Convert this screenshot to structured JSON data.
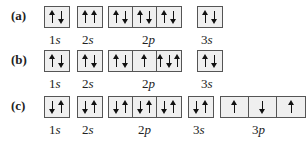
{
  "rows": [
    {
      "label": "(a)",
      "subshells": [
        {
          "name": "1s",
          "num": "1",
          "letter": "s",
          "orbitals": [
            [
              "up",
              "down"
            ]
          ]
        },
        {
          "name": "2s",
          "num": "2",
          "letter": "s",
          "orbitals": [
            [
              "up",
              "up"
            ]
          ]
        },
        {
          "name": "2p",
          "num": "2",
          "letter": "p",
          "orbitals": [
            [
              "up",
              "down"
            ],
            [
              "up",
              "down"
            ],
            [
              "up",
              "down"
            ]
          ]
        },
        {
          "name": "3s",
          "num": "3",
          "letter": "s",
          "orbitals": [
            [
              "up",
              "down"
            ]
          ]
        }
      ]
    },
    {
      "label": "(b)",
      "subshells": [
        {
          "name": "1s",
          "num": "1",
          "letter": "s",
          "orbitals": [
            [
              "up",
              "down"
            ]
          ]
        },
        {
          "name": "2s",
          "num": "2",
          "letter": "s",
          "orbitals": [
            [
              "up",
              "down"
            ]
          ]
        },
        {
          "name": "2p",
          "num": "2",
          "letter": "p",
          "orbitals": [
            [
              "up",
              "down"
            ],
            [
              "up"
            ],
            [
              "up",
              "down",
              "up"
            ]
          ]
        },
        {
          "name": "3s",
          "num": "3",
          "letter": "s",
          "orbitals": [
            [
              "up",
              "down"
            ]
          ]
        }
      ]
    },
    {
      "label": "(c)",
      "subshells": [
        {
          "name": "1s",
          "num": "1",
          "letter": "s",
          "orbitals": [
            [
              "down",
              "up"
            ]
          ]
        },
        {
          "name": "2s",
          "num": "2",
          "letter": "s",
          "orbitals": [
            [
              "down",
              "up"
            ]
          ]
        },
        {
          "name": "2p",
          "num": "2",
          "letter": "p",
          "orbitals": [
            [
              "down",
              "up"
            ],
            [
              "down",
              "up"
            ],
            [
              "down",
              "up"
            ]
          ]
        },
        {
          "name": "3s",
          "num": "3",
          "letter": "s",
          "orbitals": [
            [
              "down",
              "up"
            ]
          ]
        },
        {
          "name": "3p",
          "num": "3",
          "letter": "p",
          "orbitals": [
            [
              "up"
            ],
            [
              "down"
            ],
            [
              "up"
            ]
          ]
        }
      ]
    }
  ]
}
